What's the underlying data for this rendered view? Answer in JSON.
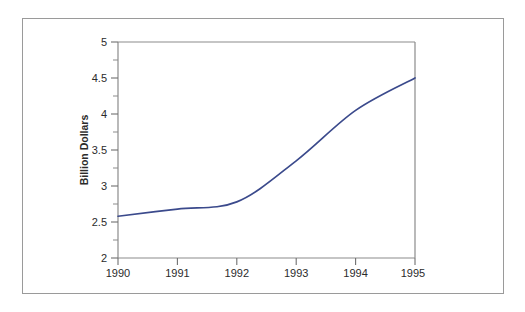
{
  "chart_data": {
    "type": "line",
    "title": "",
    "subtitle": "",
    "xlabel": "",
    "ylabel": "Billion Dollars",
    "x": [
      1990,
      1991,
      1992,
      1993,
      1994,
      1995
    ],
    "categories": [
      "1990",
      "1991",
      "1992",
      "1993",
      "1994",
      "1995"
    ],
    "values": [
      2.58,
      2.68,
      2.78,
      3.35,
      4.05,
      4.5
    ],
    "series": [
      {
        "name": "Billion Dollars",
        "values": [
          2.58,
          2.68,
          2.78,
          3.35,
          4.05,
          4.5
        ],
        "color": "#3b4a8c"
      }
    ],
    "xlim": [
      1990,
      1995
    ],
    "ylim": [
      2,
      5
    ],
    "x_tick_labels": [
      "1990",
      "1991",
      "1992",
      "1993",
      "1994",
      "1995"
    ],
    "y_tick_labels": [
      "2",
      "2.5",
      "3",
      "3.5",
      "4",
      "4.5",
      "5"
    ],
    "y_major_ticks": [
      2,
      2.5,
      3,
      3.5,
      4,
      4.5,
      5
    ],
    "y_minor_ticks": [
      2.25,
      2.75,
      3.25,
      3.75,
      4.25,
      4.75
    ],
    "grid": false,
    "legend": false,
    "legend_position": "none"
  },
  "axes": {
    "y_title": "Billion Dollars",
    "y_labels": [
      "5",
      "4.5",
      "4",
      "3.5",
      "3",
      "2.5",
      "2"
    ],
    "x_labels": [
      "1990",
      "1991",
      "1992",
      "1993",
      "1994",
      "1995"
    ]
  },
  "colors": {
    "line": "#3b4a8c",
    "axis": "#8b8b8b",
    "frame": "#9a9a9a",
    "text": "#2b2b2b",
    "background": "#ffffff"
  }
}
